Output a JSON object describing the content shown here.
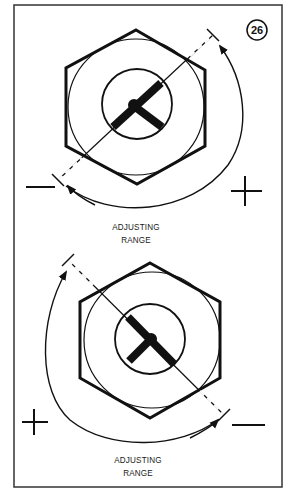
{
  "figure": {
    "number": "26",
    "colors": {
      "ink": "#111111",
      "background": "#ffffff",
      "frame": "#333333"
    }
  },
  "diagrams": [
    {
      "id": "upper",
      "label_line1": "ADJUSTING",
      "label_line2": "RANGE",
      "minus_sign": "−",
      "plus_sign": "+",
      "arrow_direction": "clockwise",
      "slot_orientation": "ne-sw"
    },
    {
      "id": "lower",
      "label_line1": "ADJUSTING",
      "label_line2": "RANGE",
      "minus_sign": "−",
      "plus_sign": "+",
      "arrow_direction": "counter-clockwise",
      "slot_orientation": "nw-se"
    }
  ]
}
